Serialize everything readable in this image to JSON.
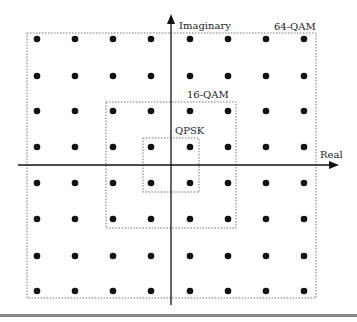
{
  "diagram": {
    "axes": {
      "x_label": "Real",
      "y_label": "Imaginary"
    },
    "regions": [
      {
        "label": "64-QAM",
        "points": 64
      },
      {
        "label": "16-QAM",
        "points": 16
      },
      {
        "label": "QPSK",
        "points": 4
      }
    ],
    "grid": {
      "columns": [
        37,
        75,
        113,
        151,
        190,
        228,
        266,
        304
      ],
      "rows": [
        39,
        76,
        111,
        147,
        183,
        219,
        256,
        291
      ]
    },
    "colors": {
      "dot": "#111111",
      "axis": "#111111",
      "box": "#777777",
      "footer_line": "#888888"
    }
  }
}
